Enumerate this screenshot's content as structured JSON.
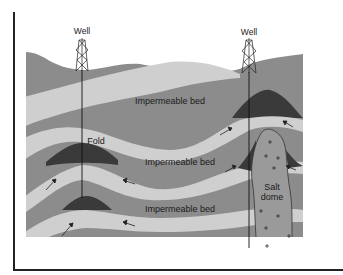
{
  "diagram": {
    "wells": [
      {
        "label": "Well"
      },
      {
        "label": "Well"
      }
    ],
    "labels": {
      "impermeable_bed_top": "Impermeable bed",
      "impermeable_bed_middle": "Impermeable bed",
      "impermeable_bed_bottom": "Impermeable bed",
      "fold": "Fold",
      "salt_dome_line1": "Salt",
      "salt_dome_line2": "dome"
    },
    "legend_colors": {
      "permeable_layer": "#cfcfcf",
      "impermeable_layer": "#8a8a8a",
      "oil_trap": "#3a3a3a",
      "salt_dome": "#9a9a9a",
      "surface_layer": "#8c8c8c"
    },
    "flow_arrows_count": 8,
    "salt_symbol": "+"
  }
}
